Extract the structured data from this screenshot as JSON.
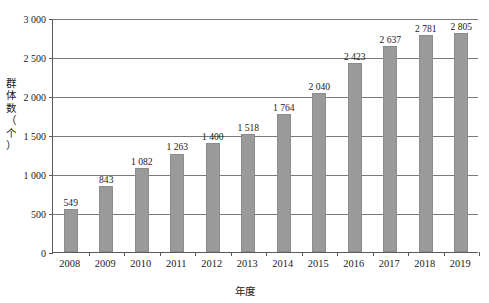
{
  "chart_data": {
    "type": "bar",
    "title": "",
    "xlabel": "年度",
    "ylabel_lines": [
      "群",
      "体",
      "数",
      "（",
      "个",
      "）"
    ],
    "ylabel": "群体数（个）",
    "categories": [
      "2008",
      "2009",
      "2010",
      "2011",
      "2012",
      "2013",
      "2014",
      "2015",
      "2016",
      "2017",
      "2018",
      "2019"
    ],
    "values": [
      549,
      843,
      1082,
      1263,
      1400,
      1518,
      1764,
      2040,
      2423,
      2637,
      2781,
      2805
    ],
    "value_labels": [
      "549",
      "843",
      "1 082",
      "1 263",
      "1 400",
      "1 518",
      "1 764",
      "2 040",
      "2 423",
      "2 637",
      "2 781",
      "2 805"
    ],
    "ylim": [
      0,
      3000
    ],
    "yticks": [
      0,
      500,
      1000,
      1500,
      2000,
      2500,
      3000
    ],
    "ytick_labels": [
      "0",
      "500",
      "1 000",
      "1 500",
      "2 000",
      "2 500",
      "3 000"
    ],
    "grid": true,
    "legend": null,
    "series_color": "#9a9a9a",
    "axis_color": "#5a5a5a"
  }
}
